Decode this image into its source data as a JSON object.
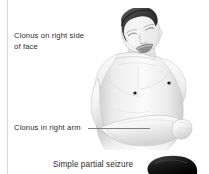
{
  "page": {
    "background_color": "#ffffff",
    "text_color": "#2b2b2b",
    "rule_color": "#d8d8d8",
    "leader_color": "#808080"
  },
  "annotations": [
    {
      "id": "clonus-face",
      "text": "Clonus on right side\nof face",
      "has_leader_line": false
    },
    {
      "id": "clonus-arm",
      "text": "Clonus in right arm",
      "has_leader_line": true
    }
  ],
  "caption": {
    "text": "Simple partial seizure"
  },
  "illustration": {
    "subject": "seated shirtless male figure, head tilted back and turned, eyes closed, mouth open, right arm flexed across abdomen",
    "style": "grayscale medical line drawing",
    "markers": "two dark nipple marks on chest"
  },
  "second_figure": {
    "description": "dark hair of an adjacent figure entering from the bottom edge"
  }
}
